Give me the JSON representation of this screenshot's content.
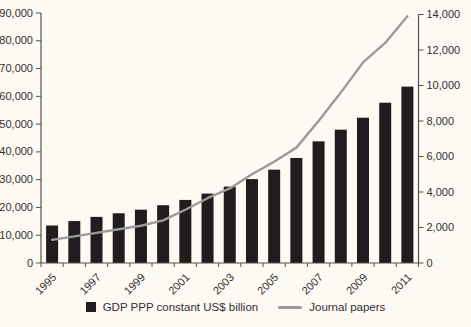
{
  "chart_data": {
    "type": "combo-bar-line",
    "title": "",
    "x": [
      "1995",
      "1996",
      "1997",
      "1998",
      "1999",
      "2000",
      "2001",
      "2002",
      "2003",
      "2004",
      "2005",
      "2006",
      "2007",
      "2008",
      "2009",
      "2010",
      "2011"
    ],
    "x_axis_visible_labels": [
      "1995",
      "1997",
      "1999",
      "2001",
      "2003",
      "2005",
      "2007",
      "2009",
      "2011"
    ],
    "series": [
      {
        "name": "GDP PPP constant US$ billion",
        "type": "bar",
        "axis": "left",
        "values": [
          13500,
          15100,
          16600,
          17900,
          19200,
          20800,
          22700,
          25000,
          27500,
          30200,
          33600,
          37800,
          43800,
          48000,
          52300,
          57700,
          63500
        ]
      },
      {
        "name": "Journal papers",
        "type": "line",
        "axis": "right",
        "values": [
          1300,
          1500,
          1700,
          1900,
          2100,
          2400,
          3000,
          3650,
          4200,
          5000,
          5700,
          6500,
          8000,
          9600,
          11300,
          12400,
          13900
        ]
      }
    ],
    "left_axis": {
      "min": 0,
      "max": 90000,
      "step": 10000,
      "labels": [
        "0",
        "10,000",
        "20,000",
        "30,000",
        "40,000",
        "50,000",
        "60,000",
        "70,000",
        "80,000",
        "90,000"
      ]
    },
    "right_axis": {
      "min": 0,
      "max": 14000,
      "step": 2000,
      "labels": [
        "0",
        "2,000",
        "4,000",
        "6,000",
        "8,000",
        "10,000",
        "12,000",
        "14,000"
      ]
    },
    "grid": false,
    "legend_position": "bottom"
  },
  "colors": {
    "bar": "#211d1e",
    "line": "#9b9b9b",
    "axis": "#57514d",
    "text": "#33302e",
    "background": "#fcfaf3"
  }
}
